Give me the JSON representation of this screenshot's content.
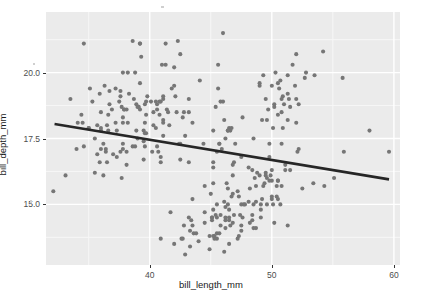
{
  "chart_data": {
    "type": "scatter",
    "title": "",
    "subtitle": "",
    "xlabel": "bill_length_mm",
    "ylabel": "bill_depth_mm",
    "xlim": [
      31.5,
      60.5
    ],
    "ylim": [
      12.7,
      22.3
    ],
    "xticks": [
      40,
      50,
      60
    ],
    "xtick_labels": [
      "40",
      "50",
      "60"
    ],
    "yticks": [
      15.0,
      17.5,
      20.0
    ],
    "ytick_labels": [
      "15.0",
      "17.5",
      "20.0"
    ],
    "x_minor_ticks": [
      35,
      45,
      55
    ],
    "y_minor_ticks": [
      13.75,
      16.25,
      18.75,
      21.25
    ],
    "grid": true,
    "grid_major_color": "#ffffff",
    "grid_minor_color": "#f7f7f7",
    "panel_background": "#ebebeb",
    "plot_background": "#ffffff",
    "point_color": "#767676",
    "point_size": 3.2,
    "legend": null,
    "legend_position": "none",
    "annotations": [],
    "trend_line": {
      "type": "linear-fit",
      "color": "#262626",
      "width": 2.6,
      "x_start": 32.2,
      "y_start": 18.05,
      "x_end": 59.6,
      "y_end": 15.95,
      "slope": -0.0766,
      "intercept": 20.52
    },
    "points": [
      [
        39.1,
        18.7
      ],
      [
        39.5,
        17.4
      ],
      [
        40.3,
        18.0
      ],
      [
        36.7,
        19.3
      ],
      [
        39.3,
        20.6
      ],
      [
        38.9,
        17.8
      ],
      [
        39.2,
        19.6
      ],
      [
        34.1,
        18.1
      ],
      [
        42.0,
        20.2
      ],
      [
        37.8,
        17.1
      ],
      [
        37.8,
        17.3
      ],
      [
        41.1,
        17.6
      ],
      [
        38.6,
        21.2
      ],
      [
        34.6,
        21.1
      ],
      [
        36.6,
        17.8
      ],
      [
        38.7,
        19.0
      ],
      [
        42.5,
        20.7
      ],
      [
        34.4,
        18.4
      ],
      [
        46.0,
        21.5
      ],
      [
        37.8,
        18.3
      ],
      [
        37.7,
        18.7
      ],
      [
        35.9,
        19.2
      ],
      [
        38.2,
        18.1
      ],
      [
        38.8,
        17.2
      ],
      [
        35.3,
        18.9
      ],
      [
        40.6,
        18.6
      ],
      [
        40.5,
        17.9
      ],
      [
        37.9,
        18.6
      ],
      [
        40.5,
        18.9
      ],
      [
        39.5,
        16.7
      ],
      [
        37.2,
        18.1
      ],
      [
        39.5,
        17.8
      ],
      [
        40.9,
        18.9
      ],
      [
        36.4,
        17.0
      ],
      [
        39.2,
        21.1
      ],
      [
        38.8,
        20.0
      ],
      [
        42.2,
        18.5
      ],
      [
        37.6,
        19.3
      ],
      [
        39.8,
        19.1
      ],
      [
        36.5,
        18.0
      ],
      [
        40.8,
        18.4
      ],
      [
        36.0,
        18.5
      ],
      [
        44.1,
        19.7
      ],
      [
        37.0,
        16.9
      ],
      [
        39.6,
        18.8
      ],
      [
        41.1,
        19.0
      ],
      [
        37.5,
        18.9
      ],
      [
        36.0,
        17.9
      ],
      [
        42.3,
        21.2
      ],
      [
        39.6,
        17.7
      ],
      [
        40.1,
        18.9
      ],
      [
        35.0,
        17.9
      ],
      [
        42.0,
        19.5
      ],
      [
        34.5,
        18.1
      ],
      [
        41.4,
        18.6
      ],
      [
        39.0,
        17.5
      ],
      [
        40.6,
        18.8
      ],
      [
        36.5,
        16.6
      ],
      [
        37.6,
        19.1
      ],
      [
        35.7,
        16.9
      ],
      [
        41.3,
        21.1
      ],
      [
        37.6,
        17.0
      ],
      [
        41.1,
        18.2
      ],
      [
        36.4,
        17.1
      ],
      [
        41.6,
        18.0
      ],
      [
        35.5,
        16.2
      ],
      [
        41.1,
        19.1
      ],
      [
        35.9,
        16.6
      ],
      [
        41.8,
        19.4
      ],
      [
        33.5,
        19.0
      ],
      [
        39.7,
        18.4
      ],
      [
        39.6,
        17.2
      ],
      [
        45.8,
        18.9
      ],
      [
        35.5,
        17.5
      ],
      [
        42.8,
        18.5
      ],
      [
        40.9,
        16.8
      ],
      [
        37.2,
        19.4
      ],
      [
        36.2,
        16.1
      ],
      [
        42.1,
        19.1
      ],
      [
        34.6,
        17.2
      ],
      [
        42.9,
        17.6
      ],
      [
        36.7,
        18.8
      ],
      [
        35.1,
        19.4
      ],
      [
        37.3,
        17.8
      ],
      [
        41.3,
        20.3
      ],
      [
        36.3,
        19.5
      ],
      [
        36.9,
        18.6
      ],
      [
        38.3,
        19.2
      ],
      [
        38.9,
        18.8
      ],
      [
        35.7,
        18.0
      ],
      [
        41.1,
        18.1
      ],
      [
        34.0,
        17.1
      ],
      [
        39.6,
        18.1
      ],
      [
        36.2,
        17.3
      ],
      [
        40.8,
        18.9
      ],
      [
        38.1,
        18.6
      ],
      [
        40.3,
        18.5
      ],
      [
        33.1,
        16.1
      ],
      [
        43.2,
        18.5
      ],
      [
        35.0,
        17.9
      ],
      [
        41.0,
        20.3
      ],
      [
        37.7,
        16.0
      ],
      [
        37.8,
        20.0
      ],
      [
        37.9,
        18.6
      ],
      [
        39.7,
        18.9
      ],
      [
        38.6,
        17.2
      ],
      [
        38.2,
        20.0
      ],
      [
        38.1,
        17.0
      ],
      [
        43.2,
        19.0
      ],
      [
        38.1,
        16.5
      ],
      [
        45.6,
        20.3
      ],
      [
        39.7,
        17.7
      ],
      [
        42.7,
        18.3
      ],
      [
        39.2,
        21.1
      ],
      [
        40.2,
        17.0
      ],
      [
        40.6,
        17.2
      ],
      [
        32.1,
        15.5
      ],
      [
        40.7,
        17.0
      ],
      [
        37.3,
        16.8
      ],
      [
        39.0,
        18.7
      ],
      [
        39.2,
        18.6
      ],
      [
        36.6,
        18.4
      ],
      [
        36.0,
        17.8
      ],
      [
        37.8,
        18.1
      ],
      [
        36.0,
        17.1
      ],
      [
        41.5,
        18.5
      ],
      [
        46.1,
        13.2
      ],
      [
        50.0,
        16.3
      ],
      [
        48.7,
        14.1
      ],
      [
        50.0,
        15.2
      ],
      [
        47.6,
        14.5
      ],
      [
        46.5,
        13.5
      ],
      [
        45.4,
        14.6
      ],
      [
        46.7,
        15.3
      ],
      [
        43.3,
        13.4
      ],
      [
        46.8,
        15.4
      ],
      [
        40.9,
        13.7
      ],
      [
        49.0,
        16.1
      ],
      [
        45.5,
        13.7
      ],
      [
        48.4,
        14.6
      ],
      [
        45.8,
        14.6
      ],
      [
        49.3,
        15.7
      ],
      [
        42.0,
        13.5
      ],
      [
        49.2,
        15.2
      ],
      [
        46.2,
        14.5
      ],
      [
        48.7,
        15.1
      ],
      [
        50.2,
        14.3
      ],
      [
        45.1,
        14.5
      ],
      [
        46.5,
        14.5
      ],
      [
        46.3,
        15.8
      ],
      [
        42.9,
        13.1
      ],
      [
        46.1,
        15.1
      ],
      [
        44.5,
        14.3
      ],
      [
        47.8,
        15.0
      ],
      [
        48.2,
        14.3
      ],
      [
        50.0,
        15.3
      ],
      [
        47.3,
        15.3
      ],
      [
        42.8,
        14.2
      ],
      [
        45.1,
        14.5
      ],
      [
        59.6,
        17.0
      ],
      [
        49.1,
        14.8
      ],
      [
        48.4,
        16.3
      ],
      [
        42.6,
        13.7
      ],
      [
        44.4,
        17.3
      ],
      [
        44.0,
        13.6
      ],
      [
        48.7,
        15.7
      ],
      [
        42.7,
        13.7
      ],
      [
        49.6,
        16.0
      ],
      [
        45.3,
        13.7
      ],
      [
        49.6,
        15.0
      ],
      [
        50.5,
        15.9
      ],
      [
        43.6,
        13.9
      ],
      [
        45.5,
        13.9
      ],
      [
        50.5,
        15.9
      ],
      [
        44.9,
        13.3
      ],
      [
        45.2,
        15.8
      ],
      [
        46.6,
        14.2
      ],
      [
        48.5,
        14.1
      ],
      [
        45.1,
        14.4
      ],
      [
        50.1,
        15.0
      ],
      [
        46.5,
        14.4
      ],
      [
        45.0,
        15.4
      ],
      [
        43.8,
        13.9
      ],
      [
        45.5,
        15.0
      ],
      [
        43.2,
        14.5
      ],
      [
        50.4,
        15.3
      ],
      [
        45.3,
        13.8
      ],
      [
        46.2,
        14.9
      ],
      [
        45.7,
        13.9
      ],
      [
        54.3,
        15.7
      ],
      [
        45.8,
        14.2
      ],
      [
        49.8,
        16.8
      ],
      [
        46.2,
        14.4
      ],
      [
        49.5,
        16.2
      ],
      [
        43.5,
        14.2
      ],
      [
        50.7,
        15.0
      ],
      [
        47.7,
        15.0
      ],
      [
        46.4,
        15.6
      ],
      [
        48.2,
        15.6
      ],
      [
        46.5,
        14.8
      ],
      [
        46.4,
        15.0
      ],
      [
        48.6,
        16.0
      ],
      [
        47.5,
        14.2
      ],
      [
        51.1,
        16.3
      ],
      [
        45.2,
        13.8
      ],
      [
        45.2,
        16.4
      ],
      [
        49.1,
        14.5
      ],
      [
        52.5,
        15.6
      ],
      [
        47.4,
        14.6
      ],
      [
        50.0,
        15.9
      ],
      [
        44.9,
        13.8
      ],
      [
        50.8,
        17.3
      ],
      [
        43.4,
        14.4
      ],
      [
        51.3,
        14.2
      ],
      [
        47.5,
        14.0
      ],
      [
        52.1,
        17.0
      ],
      [
        47.5,
        15.0
      ],
      [
        52.2,
        17.1
      ],
      [
        45.5,
        14.5
      ],
      [
        49.5,
        16.1
      ],
      [
        44.5,
        14.7
      ],
      [
        50.8,
        15.7
      ],
      [
        49.4,
        15.8
      ],
      [
        46.9,
        14.6
      ],
      [
        48.4,
        14.4
      ],
      [
        51.1,
        16.5
      ],
      [
        48.5,
        15.0
      ],
      [
        55.9,
        17.0
      ],
      [
        47.2,
        15.5
      ],
      [
        49.1,
        15.0
      ],
      [
        47.3,
        13.8
      ],
      [
        46.8,
        16.1
      ],
      [
        41.7,
        14.7
      ],
      [
        53.4,
        15.8
      ],
      [
        43.3,
        14.0
      ],
      [
        48.1,
        15.1
      ],
      [
        50.5,
        15.2
      ],
      [
        49.8,
        15.9
      ],
      [
        43.5,
        15.2
      ],
      [
        51.5,
        16.3
      ],
      [
        46.2,
        14.1
      ],
      [
        55.1,
        16.0
      ],
      [
        44.5,
        15.7
      ],
      [
        48.8,
        16.2
      ],
      [
        47.2,
        13.7
      ],
      [
        46.8,
        14.3
      ],
      [
        50.4,
        15.7
      ],
      [
        45.2,
        14.8
      ],
      [
        49.9,
        16.1
      ],
      [
        46.5,
        17.9
      ],
      [
        50.0,
        19.5
      ],
      [
        51.3,
        19.2
      ],
      [
        45.4,
        18.7
      ],
      [
        52.7,
        19.8
      ],
      [
        45.2,
        17.8
      ],
      [
        46.1,
        18.2
      ],
      [
        51.3,
        18.2
      ],
      [
        46.0,
        18.9
      ],
      [
        51.3,
        19.9
      ],
      [
        46.6,
        17.8
      ],
      [
        51.7,
        20.3
      ],
      [
        47.0,
        17.3
      ],
      [
        52.0,
        18.1
      ],
      [
        45.9,
        17.1
      ],
      [
        50.5,
        19.6
      ],
      [
        50.3,
        20.0
      ],
      [
        58.0,
        17.8
      ],
      [
        46.4,
        17.8
      ],
      [
        49.2,
        18.2
      ],
      [
        42.4,
        17.3
      ],
      [
        48.5,
        17.5
      ],
      [
        43.2,
        16.6
      ],
      [
        50.6,
        19.4
      ],
      [
        46.7,
        17.9
      ],
      [
        52.0,
        19.0
      ],
      [
        50.5,
        18.4
      ],
      [
        49.5,
        19.0
      ],
      [
        46.4,
        17.8
      ],
      [
        52.8,
        20.0
      ],
      [
        40.9,
        16.6
      ],
      [
        54.2,
        20.8
      ],
      [
        42.5,
        16.7
      ],
      [
        51.0,
        18.8
      ],
      [
        49.7,
        18.6
      ],
      [
        47.5,
        16.8
      ],
      [
        47.6,
        18.3
      ],
      [
        52.0,
        20.7
      ],
      [
        46.9,
        16.6
      ],
      [
        53.5,
        19.9
      ],
      [
        49.0,
        19.5
      ],
      [
        46.2,
        17.5
      ],
      [
        50.9,
        19.1
      ],
      [
        45.5,
        17.0
      ],
      [
        50.9,
        17.9
      ],
      [
        50.8,
        18.5
      ],
      [
        50.1,
        17.9
      ],
      [
        49.0,
        19.6
      ],
      [
        51.5,
        18.7
      ],
      [
        49.8,
        17.3
      ],
      [
        48.1,
        16.4
      ],
      [
        51.4,
        19.0
      ],
      [
        45.7,
        17.3
      ],
      [
        50.7,
        19.7
      ],
      [
        42.5,
        17.3
      ],
      [
        52.2,
        18.8
      ],
      [
        45.2,
        16.6
      ],
      [
        49.3,
        19.9
      ],
      [
        50.2,
        18.8
      ],
      [
        45.6,
        19.4
      ],
      [
        51.9,
        19.5
      ],
      [
        46.8,
        16.5
      ],
      [
        45.7,
        17.3
      ],
      [
        55.8,
        19.8
      ],
      [
        43.5,
        18.1
      ],
      [
        49.6,
        18.2
      ],
      [
        50.8,
        19.0
      ],
      [
        50.2,
        18.7
      ]
    ]
  },
  "axes": {
    "x_title": "bill_length_mm",
    "y_title": "bill_depth_mm"
  }
}
